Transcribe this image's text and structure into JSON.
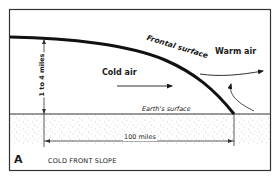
{
  "figure": {
    "panel_letter": "A",
    "caption": "COLD FRONT SLOPE",
    "labels": {
      "frontal_surface": "Frontal surface",
      "warm_air": "Warm air",
      "cold_air": "Cold air",
      "earths_surface": "Earth's surface",
      "height": "1 to 4 miles",
      "width": "100 miles"
    },
    "colors": {
      "ink": "#1a1a1a",
      "background": "#ffffff",
      "ground_stipple": "#8a8a8a"
    }
  }
}
